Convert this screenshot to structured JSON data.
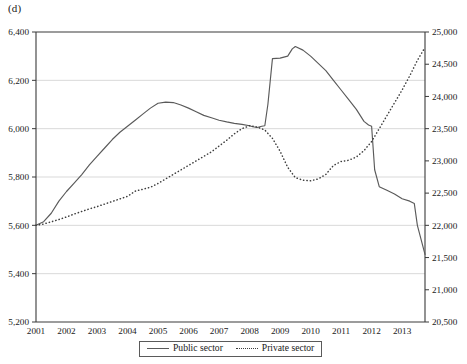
{
  "panel": {
    "label": "(d)"
  },
  "legend": {
    "position": "bottom-center",
    "entries": [
      {
        "label": "Public sector",
        "style": "solid",
        "icon": "solid-line-icon"
      },
      {
        "label": "Private sector",
        "style": "dotted",
        "icon": "dotted-line-icon"
      }
    ]
  },
  "axes": {
    "left": {
      "ticks": [
        "5,200",
        "5,400",
        "5,600",
        "5,800",
        "6,000",
        "6,200",
        "6,400"
      ],
      "min": 5200,
      "max": 6400,
      "step": 200,
      "grid": true
    },
    "right": {
      "ticks": [
        "20,500",
        "21,000",
        "21,500",
        "22,000",
        "22,500",
        "23,000",
        "23,500",
        "24,000",
        "24,500",
        "25,000"
      ],
      "min": 20500,
      "max": 25000,
      "step": 500,
      "grid": false
    },
    "bottom": {
      "ticks": [
        "2001",
        "2002",
        "2003",
        "2004",
        "2005",
        "2006",
        "2007",
        "2008",
        "2009",
        "2010",
        "2011",
        "2012",
        "2013"
      ],
      "min": 2001,
      "max": 2013.75
    }
  },
  "chart_data": {
    "type": "line",
    "title": "(d)",
    "xlabel": "",
    "ylabel": "",
    "grid": true,
    "legend_position": "bottom-center",
    "xlim": [
      2001,
      2013.75
    ],
    "x_tick_labels": [
      "2001",
      "2002",
      "2003",
      "2004",
      "2005",
      "2006",
      "2007",
      "2008",
      "2009",
      "2010",
      "2011",
      "2012",
      "2013"
    ],
    "series": [
      {
        "name": "Public sector",
        "axis": "left",
        "style": "solid",
        "color": "#5a5a5a",
        "ylim": [
          5200,
          6400
        ],
        "ylabel_ticks": [
          "5,200",
          "5,400",
          "5,600",
          "5,800",
          "6,000",
          "6,200",
          "6,400"
        ],
        "x": [
          2001.0,
          2001.25,
          2001.5,
          2001.75,
          2002.0,
          2002.25,
          2002.5,
          2002.75,
          2003.0,
          2003.25,
          2003.5,
          2003.75,
          2004.0,
          2004.25,
          2004.5,
          2004.75,
          2005.0,
          2005.25,
          2005.5,
          2005.75,
          2006.0,
          2006.25,
          2006.5,
          2006.75,
          2007.0,
          2007.25,
          2007.5,
          2007.75,
          2008.0,
          2008.1,
          2008.25,
          2008.4,
          2008.5,
          2008.6,
          2008.75,
          2009.0,
          2009.25,
          2009.4,
          2009.5,
          2009.75,
          2010.0,
          2010.25,
          2010.5,
          2010.75,
          2011.0,
          2011.25,
          2011.5,
          2011.75,
          2011.9,
          2012.0,
          2012.1,
          2012.25,
          2012.5,
          2012.75,
          2013.0,
          2013.25,
          2013.4,
          2013.5,
          2013.75
        ],
        "y": [
          5600,
          5615,
          5650,
          5700,
          5740,
          5775,
          5810,
          5850,
          5885,
          5920,
          5955,
          5985,
          6010,
          6035,
          6060,
          6085,
          6105,
          6110,
          6108,
          6098,
          6085,
          6070,
          6055,
          6045,
          6035,
          6028,
          6022,
          6018,
          6012,
          6008,
          6005,
          6010,
          6012,
          6100,
          6290,
          6292,
          6300,
          6330,
          6340,
          6325,
          6300,
          6270,
          6240,
          6200,
          6160,
          6120,
          6080,
          6030,
          6015,
          6010,
          5830,
          5760,
          5745,
          5730,
          5710,
          5700,
          5690,
          5600,
          5480
        ]
      },
      {
        "name": "Private sector",
        "axis": "right",
        "style": "dotted",
        "color": "#3d3d3d",
        "ylim": [
          20500,
          25000
        ],
        "ylabel_ticks": [
          "20,500",
          "21,000",
          "21,500",
          "22,000",
          "22,500",
          "23,000",
          "23,500",
          "24,000",
          "24,500",
          "25,000"
        ],
        "x": [
          2001.0,
          2001.25,
          2001.5,
          2001.75,
          2002.0,
          2002.25,
          2002.5,
          2002.75,
          2003.0,
          2003.25,
          2003.5,
          2003.75,
          2004.0,
          2004.25,
          2004.5,
          2004.75,
          2005.0,
          2005.25,
          2005.5,
          2005.75,
          2006.0,
          2006.25,
          2006.5,
          2006.75,
          2007.0,
          2007.25,
          2007.5,
          2007.75,
          2008.0,
          2008.25,
          2008.5,
          2008.75,
          2009.0,
          2009.25,
          2009.5,
          2009.75,
          2010.0,
          2010.25,
          2010.5,
          2010.75,
          2011.0,
          2011.25,
          2011.5,
          2011.75,
          2012.0,
          2012.25,
          2012.5,
          2012.75,
          2013.0,
          2013.25,
          2013.5,
          2013.75
        ],
        "y": [
          22000,
          22020,
          22055,
          22090,
          22130,
          22175,
          22215,
          22255,
          22290,
          22330,
          22370,
          22410,
          22450,
          22530,
          22560,
          22590,
          22650,
          22720,
          22790,
          22860,
          22930,
          23000,
          23070,
          23140,
          23230,
          23320,
          23420,
          23500,
          23545,
          23525,
          23480,
          23350,
          23150,
          22900,
          22740,
          22700,
          22690,
          22720,
          22790,
          22930,
          22990,
          23010,
          23060,
          23160,
          23300,
          23500,
          23700,
          23900,
          24100,
          24320,
          24560,
          24760
        ]
      }
    ]
  }
}
